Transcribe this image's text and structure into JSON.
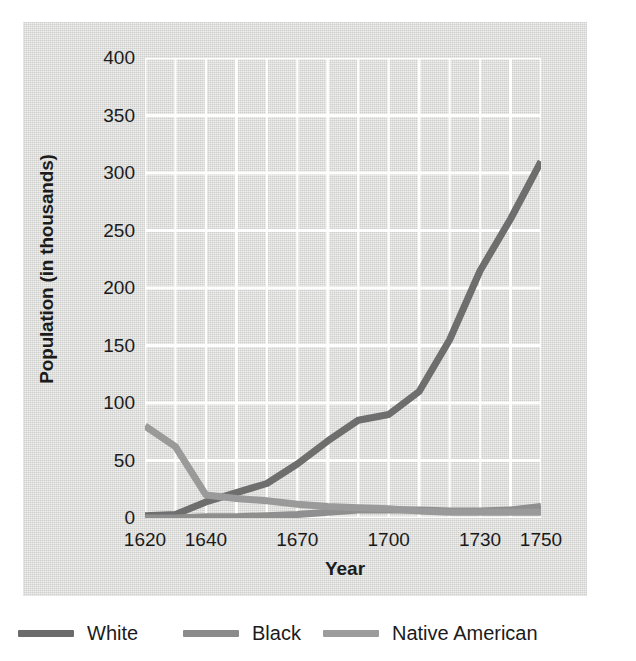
{
  "figure": {
    "background_color": "#ffffff",
    "panel_color": "#dededc"
  },
  "chart_data": {
    "type": "line",
    "title": "",
    "xlabel": "Year",
    "ylabel": "Population (in thousands)",
    "xlim": [
      1620,
      1750
    ],
    "ylim": [
      0,
      400
    ],
    "x_tick_labels": [
      "1620",
      "1640",
      "1670",
      "1700",
      "1730",
      "1750"
    ],
    "x_ticks": [
      1620,
      1640,
      1670,
      1700,
      1730,
      1750
    ],
    "y_tick_labels": [
      "0",
      "50",
      "100",
      "150",
      "200",
      "250",
      "300",
      "350",
      "400"
    ],
    "y_ticks": [
      0,
      50,
      100,
      150,
      200,
      250,
      300,
      350,
      400
    ],
    "grid": "white gridlines, vertical every 10 years, horizontal every 50 thousand",
    "legend_position": "below plot, horizontal",
    "x": [
      1620,
      1630,
      1640,
      1650,
      1660,
      1670,
      1680,
      1690,
      1700,
      1710,
      1720,
      1730,
      1740,
      1750
    ],
    "series": [
      {
        "name": "White",
        "color": "#6e6e6e",
        "values": [
          2,
          3,
          14,
          22,
          30,
          47,
          67,
          85,
          90,
          110,
          155,
          215,
          260,
          310
        ]
      },
      {
        "name": "Black",
        "color": "#8f8f8f",
        "values": [
          0,
          0,
          1,
          1,
          2,
          3,
          5,
          7,
          7,
          7,
          6,
          6,
          7,
          10
        ]
      },
      {
        "name": "Native American",
        "color": "#9a9a9a",
        "values": [
          80,
          62,
          20,
          17,
          15,
          12,
          10,
          9,
          8,
          6,
          5,
          5,
          5,
          5
        ]
      }
    ]
  },
  "legend": {
    "items": [
      {
        "label": "White",
        "color": "#6b6b6b",
        "x": 18
      },
      {
        "label": "Black",
        "color": "#8b8b8b",
        "x": 183
      },
      {
        "label": "Native American",
        "color": "#9c9c9c",
        "x": 323
      }
    ]
  }
}
